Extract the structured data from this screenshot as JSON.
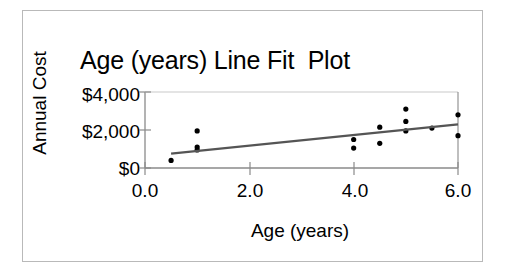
{
  "chart_data": {
    "type": "scatter",
    "title": "Age (years) Line Fit  Plot",
    "xlabel": "Age (years)",
    "ylabel": "Annual Cost",
    "xlim": [
      0.0,
      6.0
    ],
    "ylim": [
      0,
      4000
    ],
    "xticks": [
      "0.0",
      "2.0",
      "4.0",
      "6.0"
    ],
    "xtick_values": [
      0.0,
      2.0,
      4.0,
      6.0
    ],
    "yticks": [
      "$0",
      "$2,000",
      "$4,000"
    ],
    "ytick_values": [
      0,
      2000,
      4000
    ],
    "grid": false,
    "legend": "none",
    "series": [
      {
        "name": "Annual Cost",
        "type": "scatter",
        "marker": "dot",
        "color": "#000000",
        "points": [
          {
            "x": 0.5,
            "y": 400
          },
          {
            "x": 1.0,
            "y": 1950
          },
          {
            "x": 1.0,
            "y": 1100
          },
          {
            "x": 1.0,
            "y": 950
          },
          {
            "x": 4.0,
            "y": 1500
          },
          {
            "x": 4.0,
            "y": 1050
          },
          {
            "x": 4.5,
            "y": 2150
          },
          {
            "x": 4.5,
            "y": 1300
          },
          {
            "x": 5.0,
            "y": 3100
          },
          {
            "x": 5.0,
            "y": 2450
          },
          {
            "x": 5.0,
            "y": 1950
          },
          {
            "x": 5.5,
            "y": 2100
          },
          {
            "x": 6.0,
            "y": 2800
          },
          {
            "x": 6.0,
            "y": 1700
          }
        ]
      },
      {
        "name": "Predicted Annual Cost",
        "type": "line",
        "color": "#555555",
        "points": [
          {
            "x": 0.5,
            "y": 760
          },
          {
            "x": 6.0,
            "y": 2300
          }
        ]
      }
    ]
  }
}
